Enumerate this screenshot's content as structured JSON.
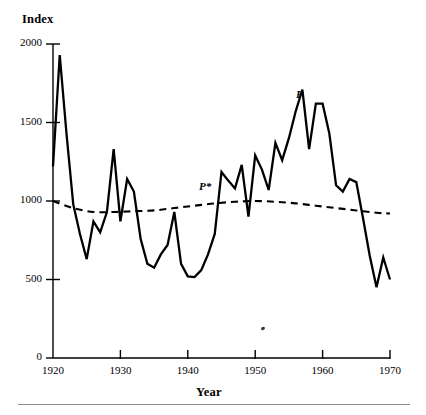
{
  "chart_data": {
    "type": "line",
    "title": "",
    "ylabel": "Index",
    "xlabel": "Year",
    "xlim": [
      1920,
      1970
    ],
    "ylim": [
      0,
      2000
    ],
    "xticks": [
      1920,
      1930,
      1940,
      1950,
      1960,
      1970
    ],
    "xtick_labels": [
      "1920",
      "1930",
      "1940",
      "1950",
      "1960",
      "1970"
    ],
    "yticks": [
      0,
      500,
      1000,
      1500,
      2000
    ],
    "ytick_labels": [
      "0",
      "500",
      "1000",
      "1500",
      "2000"
    ],
    "grid": false,
    "legend_position": "inline-annotation",
    "annotations": [
      {
        "text": "P",
        "x": 1957,
        "y": 1640,
        "style": "italic",
        "series": "P"
      },
      {
        "text": "P*",
        "x": 1941,
        "y": 1040,
        "style": "italic",
        "series": "P*"
      }
    ],
    "series": [
      {
        "name": "P",
        "style": "solid",
        "color": "#000000",
        "x": [
          1920,
          1921,
          1922,
          1923,
          1924,
          1925,
          1926,
          1927,
          1928,
          1929,
          1930,
          1931,
          1932,
          1933,
          1934,
          1935,
          1936,
          1937,
          1938,
          1939,
          1940,
          1941,
          1942,
          1943,
          1944,
          1945,
          1946,
          1947,
          1948,
          1949,
          1950,
          1951,
          1952,
          1953,
          1954,
          1955,
          1956,
          1957,
          1958,
          1959,
          1960,
          1961,
          1962,
          1963,
          1964,
          1965,
          1966,
          1967,
          1968,
          1969,
          1970
        ],
        "values": [
          1220,
          1930,
          1430,
          980,
          790,
          630,
          870,
          800,
          930,
          1330,
          870,
          1140,
          1060,
          760,
          600,
          575,
          660,
          720,
          930,
          600,
          520,
          515,
          560,
          660,
          790,
          1185,
          1130,
          1080,
          1230,
          900,
          1290,
          1200,
          1070,
          1370,
          1260,
          1400,
          1570,
          1710,
          1330,
          1620,
          1620,
          1430,
          1100,
          1060,
          1140,
          1120,
          890,
          650,
          450,
          640,
          500
        ]
      },
      {
        "name": "P*",
        "style": "dashed",
        "color": "#000000",
        "x": [
          1920,
          1923,
          1926,
          1929,
          1932,
          1935,
          1938,
          1941,
          1944,
          1947,
          1950,
          1953,
          1956,
          1959,
          1962,
          1965,
          1968,
          1970
        ],
        "values": [
          1000,
          955,
          930,
          930,
          935,
          940,
          955,
          970,
          985,
          995,
          1000,
          995,
          985,
          970,
          955,
          940,
          925,
          920
        ]
      }
    ]
  },
  "axis": {
    "y_title": "Index",
    "x_title": "Year"
  }
}
